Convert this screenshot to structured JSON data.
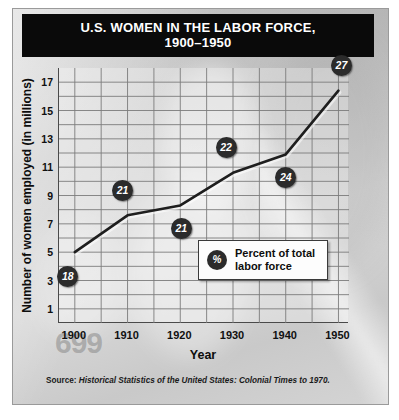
{
  "title": {
    "line1": "U.S. WOMEN IN THE LABOR FORCE,",
    "line2": "1900–1950"
  },
  "watermark": "699",
  "legend": {
    "badge": "%",
    "label": "Percent of total\nlabor force"
  },
  "source": {
    "label": "Source:",
    "text": " Historical Statistics of the United States: Colonial Times to 1970."
  },
  "colors": {
    "title_bg": "#0a0a0a",
    "title_fg": "#ffffff",
    "line": "#1e1e1e",
    "badge_bg": "#2b2b2b",
    "badge_fg": "#ffffff",
    "grid": "#7c7c7c",
    "axis": "#4a4a4a",
    "card_bg": "#d4d4d4"
  },
  "chart_data": {
    "type": "line",
    "title": "U.S. WOMEN IN THE LABOR FORCE, 1900–1950",
    "xlabel": "Year",
    "ylabel": "Number of women employed (in millions)",
    "x": [
      1900,
      1910,
      1920,
      1930,
      1940,
      1950
    ],
    "xticklabels": [
      "1900",
      "1910",
      "1920",
      "1930",
      "1940",
      "1950"
    ],
    "values": [
      5.0,
      7.6,
      8.3,
      10.6,
      11.9,
      16.4
    ],
    "point_labels": [
      "18",
      "21",
      "21",
      "22",
      "24",
      "27"
    ],
    "point_label_note": "Percent of total labor force",
    "yticks": [
      1,
      3,
      5,
      7,
      9,
      11,
      13,
      15,
      17
    ],
    "yticklabels": [
      "1",
      "3",
      "5",
      "7",
      "9",
      "11",
      "13",
      "15",
      "17"
    ],
    "xlim": [
      1897,
      1952
    ],
    "ylim": [
      0,
      18
    ],
    "grid": true,
    "grid_y_step": 1,
    "grid_x_step": 5,
    "legend": [
      "Percent of total labor force"
    ],
    "legend_position": "inside-lower-right"
  }
}
